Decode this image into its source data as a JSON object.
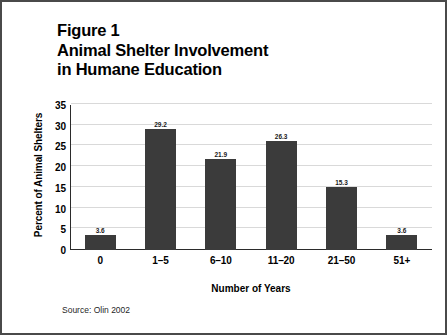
{
  "figure": {
    "title_lines": [
      "Figure 1",
      "Animal Shelter Involvement",
      "in Humane Education"
    ],
    "source_note": "Source: Olin 2002",
    "border_color": "#4a4a4a",
    "background_color": "#ffffff"
  },
  "chart_data": {
    "type": "bar",
    "title": "Figure 1 Animal Shelter Involvement in Humane Education",
    "categories": [
      "0",
      "1–5",
      "6–10",
      "11–20",
      "21–50",
      "51+"
    ],
    "values": [
      3.6,
      29.2,
      21.9,
      26.3,
      15.3,
      3.6
    ],
    "data_labels": [
      "3.6",
      "29.2",
      "21.9",
      "26.3",
      "15.3",
      "3.6"
    ],
    "xlabel": "Number of Years",
    "ylabel": "Percent of Animal Shelters",
    "ylim": [
      0,
      35
    ],
    "yticks": [
      0,
      5,
      10,
      15,
      20,
      25,
      30,
      35
    ],
    "ytick_labels": [
      "0",
      "5",
      "10",
      "15",
      "20",
      "25",
      "30",
      "35"
    ],
    "grid": "horizontal",
    "legend": "none",
    "bar_color": "#3b3b3b",
    "gridline_color": "#d9d9d9",
    "axis_color": "#2b2b2b"
  }
}
